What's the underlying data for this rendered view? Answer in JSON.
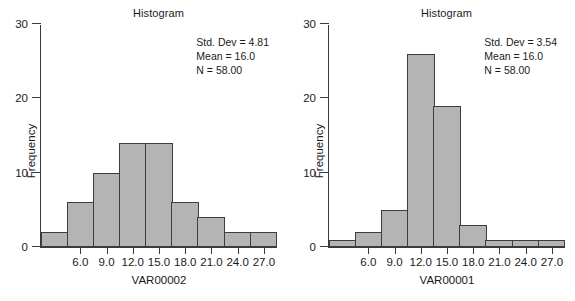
{
  "figure": {
    "width": 575,
    "height": 301,
    "background": "#ffffff",
    "bar_fill": "#b4b4b4",
    "bar_edge": "#3d3d3d",
    "axis_color": "#3a3a3a"
  },
  "panels": [
    {
      "key": "left",
      "title": "Histogram",
      "ytitle": "Frequency",
      "xtitle": "VAR00002",
      "yticks": [
        "0",
        "10",
        "20",
        "30"
      ],
      "xticks": [
        "6.0",
        "9.0",
        "12.0",
        "15.0",
        "18.0",
        "21.0",
        "24.0",
        "27.0"
      ],
      "stats": {
        "std_dev": "Std. Dev = 4.81",
        "mean": "Mean = 16.0",
        "n": "N = 58.00"
      }
    },
    {
      "key": "right",
      "title": "Histogram",
      "ytitle": "Frequency",
      "xtitle": "VAR00001",
      "yticks": [
        "0",
        "10",
        "20",
        "30"
      ],
      "xticks": [
        "6.0",
        "9.0",
        "12.0",
        "15.0",
        "18.0",
        "21.0",
        "24.0",
        "27.0"
      ],
      "stats": {
        "std_dev": "Std. Dev = 3.54",
        "mean": "Mean = 16.0",
        "n": "N = 58.00"
      }
    }
  ],
  "chart_data": [
    {
      "type": "bar",
      "title": "Histogram",
      "xlabel": "VAR00002",
      "ylabel": "Frequency",
      "ylim": [
        0,
        30
      ],
      "yticks": [
        0,
        10,
        20,
        30
      ],
      "grid": false,
      "legend": null,
      "bin_centers": [
        4.5,
        7.5,
        10.5,
        13.5,
        16.5,
        19.5,
        22.5,
        25.5,
        28.5
      ],
      "bin_width": 3.0,
      "categories": [
        "4.5",
        "7.5",
        "10.5",
        "13.5",
        "16.5",
        "19.5",
        "22.5",
        "25.5",
        "28.5"
      ],
      "values": [
        2,
        6,
        10,
        14,
        14,
        6,
        4,
        2,
        2
      ],
      "xtick_labels": [
        "6.0",
        "9.0",
        "12.0",
        "15.0",
        "18.0",
        "21.0",
        "24.0",
        "27.0"
      ],
      "xtick_values": [
        6.0,
        9.0,
        12.0,
        15.0,
        18.0,
        21.0,
        24.0,
        27.0
      ],
      "annotations": [
        "Std. Dev = 4.81",
        "Mean = 16.0",
        "N = 58.00"
      ]
    },
    {
      "type": "bar",
      "title": "Histogram",
      "xlabel": "VAR00001",
      "ylabel": "Frequency",
      "ylim": [
        0,
        30
      ],
      "yticks": [
        0,
        10,
        20,
        30
      ],
      "grid": false,
      "legend": null,
      "bin_centers": [
        4.5,
        7.5,
        10.5,
        13.5,
        16.5,
        19.5,
        22.5,
        25.5,
        28.5
      ],
      "bin_width": 3.0,
      "categories": [
        "4.5",
        "7.5",
        "10.5",
        "13.5",
        "16.5",
        "19.5",
        "22.5",
        "25.5",
        "28.5"
      ],
      "values": [
        1,
        2,
        5,
        26,
        19,
        3,
        1,
        1,
        1
      ],
      "xtick_labels": [
        "6.0",
        "9.0",
        "12.0",
        "15.0",
        "18.0",
        "21.0",
        "24.0",
        "27.0"
      ],
      "xtick_values": [
        6.0,
        9.0,
        12.0,
        15.0,
        18.0,
        21.0,
        24.0,
        27.0
      ],
      "annotations": [
        "Std. Dev = 3.54",
        "Mean = 16.0",
        "N = 58.00"
      ]
    }
  ]
}
